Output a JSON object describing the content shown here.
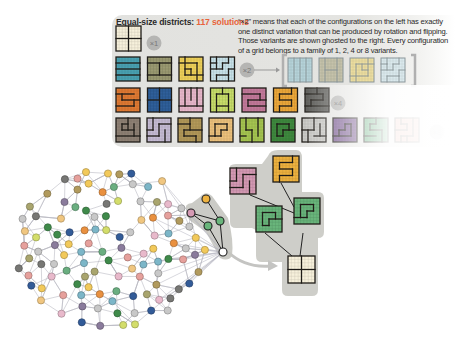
{
  "header": {
    "title_prefix": "Equal-size districts: ",
    "title_count": "117 solutions",
    "description": "“×2” means that each of the configurations on the left has exactly one distinct variation that can be produced by rotation and flipping. Those variants are shown ghosted to the right. Every configuration of a grid belongs to a family of 1, 2, 4 or 8 variants."
  },
  "multipliers": {
    "x1": "×1",
    "x2": "×2",
    "x4": "×4",
    "x8": "×8"
  },
  "colors": {
    "accent": "#e8633a",
    "panel_bg": "#e2e2df",
    "empty_grid": "#f7f1dc",
    "row2": [
      "#4aa3b3",
      "#9b9a72",
      "#efd25a",
      "#c9e3ea"
    ],
    "row2_ghost": [
      "#a9cfd9",
      "#bcb89a",
      "#f0dc8a",
      "#d6eaf0"
    ],
    "row3": [
      "#e27b33",
      "#2f5f9a",
      "#e9b9cc",
      "#c9de6a",
      "#c47b9c",
      "#eda83a",
      "#5b5b58"
    ],
    "row4": [
      "#8f8275",
      "#c7bdd6",
      "#b49a5a",
      "#eec27d",
      "#a6c651",
      "#3f8a3f",
      "#cbcbc8",
      "#7a5a93",
      "#5fb07a",
      "#ee9d8a"
    ]
  },
  "tree": {
    "nodes": [
      {
        "name": "pink",
        "color": "#d59ab4"
      },
      {
        "name": "orange",
        "color": "#eeb23f"
      },
      {
        "name": "green-left",
        "color": "#69b57b"
      },
      {
        "name": "green-right",
        "color": "#69b57b"
      },
      {
        "name": "empty",
        "color": "#f7f1dc"
      }
    ]
  },
  "network": {
    "node_colors": [
      "#8a7b9c",
      "#c8c8c8",
      "#3f8a4a",
      "#e9903f",
      "#a9a56e",
      "#d3dd6a",
      "#e6a09c",
      "#7cb6c8",
      "#325b98",
      "#f2c95a",
      "#e8b9cb",
      "#6aae80",
      "#f0c680",
      "#777774",
      "#b19a5d"
    ]
  }
}
